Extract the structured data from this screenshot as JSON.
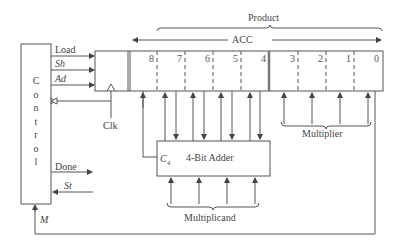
{
  "diagram": {
    "type": "block-diagram",
    "control": {
      "label_letters": [
        "C",
        "o",
        "n",
        "t",
        "r",
        "o",
        "l"
      ],
      "outputs": [
        {
          "name": "Load",
          "italic": false
        },
        {
          "name": "Sh",
          "italic": true
        },
        {
          "name": "Ad",
          "italic": true
        }
      ],
      "done_label": "Done",
      "start_label": "St",
      "m_label": "M"
    },
    "clock_label": "Clk",
    "register": {
      "product_label": "Product",
      "acc_label": "ACC",
      "bits": [
        "8",
        "7",
        "6",
        "5",
        "4",
        "3",
        "2",
        "1",
        "0"
      ],
      "multiplier_label": "Multiplier"
    },
    "adder": {
      "label": "4-Bit Adder",
      "carry_label": "C",
      "carry_subscript": "4",
      "multiplicand_label": "Multiplicand"
    },
    "colors": {
      "line": "#555555",
      "text": "#444444",
      "background": "#ffffff"
    }
  }
}
